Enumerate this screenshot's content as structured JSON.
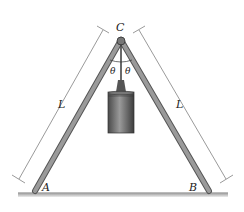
{
  "diagram": {
    "type": "statics-frame",
    "labels": {
      "apex": "C",
      "left_foot": "A",
      "right_foot": "B",
      "left_length": "L",
      "right_length": "L",
      "angle_left": "θ",
      "angle_right": "θ"
    },
    "colors": {
      "leg": "#8a8a8a",
      "leg_edge": "#555555",
      "weight": "#6e6e6e",
      "ground": "#b0b0b0",
      "dimension_line": "#555555"
    }
  }
}
